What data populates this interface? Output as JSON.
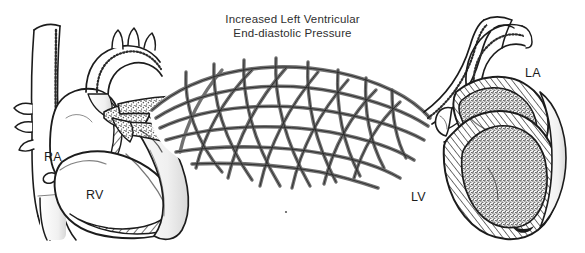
{
  "figure": {
    "kind": "anatomical-line-drawing",
    "background_color": "#ffffff",
    "ink_color": "#1c1c1c",
    "stipple_color": "#6f6f6f",
    "title": {
      "line1": "Increased Left Ventricular",
      "line2": "End-diastolic Pressure",
      "color": "#2f2f2f"
    },
    "labels": [
      {
        "id": "ra",
        "text": "RA",
        "meaning": "right atrium"
      },
      {
        "id": "rv",
        "text": "RV",
        "meaning": "right ventricle"
      },
      {
        "id": "la",
        "text": "LA",
        "meaning": "left atrium"
      },
      {
        "id": "lv",
        "text": "LV",
        "meaning": "left ventricle"
      }
    ],
    "structures": [
      {
        "name": "superior-vena-cava",
        "side": "left"
      },
      {
        "name": "inferior-vena-cava",
        "side": "left"
      },
      {
        "name": "aortic-arch",
        "side": "left"
      },
      {
        "name": "right-atrium",
        "side": "left"
      },
      {
        "name": "right-ventricle",
        "side": "left"
      },
      {
        "name": "pulmonary-artery-trunk",
        "side": "left",
        "fill": "stipple"
      },
      {
        "name": "pulmonary-capillary-bed",
        "side": "center",
        "fill": "stipple"
      },
      {
        "name": "pulmonary-veins",
        "side": "right"
      },
      {
        "name": "left-atrium",
        "side": "right",
        "fill": "stipple"
      },
      {
        "name": "left-ventricle",
        "side": "right",
        "fill": "stipple"
      },
      {
        "name": "ascending-aorta",
        "side": "right"
      },
      {
        "name": "myocardium-hatching",
        "side": "both",
        "fill": "diagonal-hatch"
      }
    ]
  }
}
